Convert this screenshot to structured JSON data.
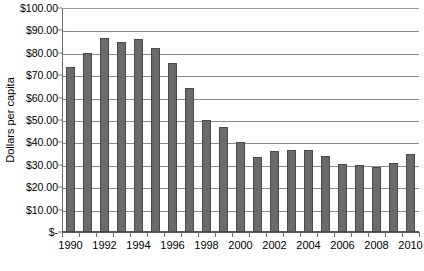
{
  "chart_data": {
    "type": "bar",
    "title": "",
    "xlabel": "",
    "ylabel": "Dollars per capita",
    "ylim": [
      0,
      100
    ],
    "grid": true,
    "legend": "none",
    "orientation": "vertical",
    "bar_color": "#6b6b6b",
    "y_tick_labels": [
      "$100.00",
      "$90.00",
      "$80.00",
      "$70.00",
      "$60.00",
      "$50.00",
      "$40.00",
      "$30.00",
      "$20.00",
      "$10.00",
      "$-"
    ],
    "y_tick_values": [
      100,
      90,
      80,
      70,
      60,
      50,
      40,
      30,
      20,
      10,
      0
    ],
    "categories": [
      "1990",
      "1991",
      "1992",
      "1993",
      "1994",
      "1995",
      "1996",
      "1997",
      "1998",
      "1999",
      "2000",
      "2001",
      "2002",
      "2003",
      "2004",
      "2005",
      "2006",
      "2007",
      "2008",
      "2009",
      "2010"
    ],
    "x_tick_labels_shown": [
      "1990",
      "1992",
      "1994",
      "1996",
      "1998",
      "2000",
      "2002",
      "2004",
      "2006",
      "2008",
      "2010"
    ],
    "values": [
      73.5,
      80.0,
      86.5,
      85.0,
      86.0,
      82.0,
      75.5,
      64.5,
      50.0,
      47.0,
      40.0,
      33.5,
      36.0,
      36.5,
      36.5,
      34.0,
      30.5,
      30.0,
      29.0,
      31.0,
      35.0
    ]
  }
}
